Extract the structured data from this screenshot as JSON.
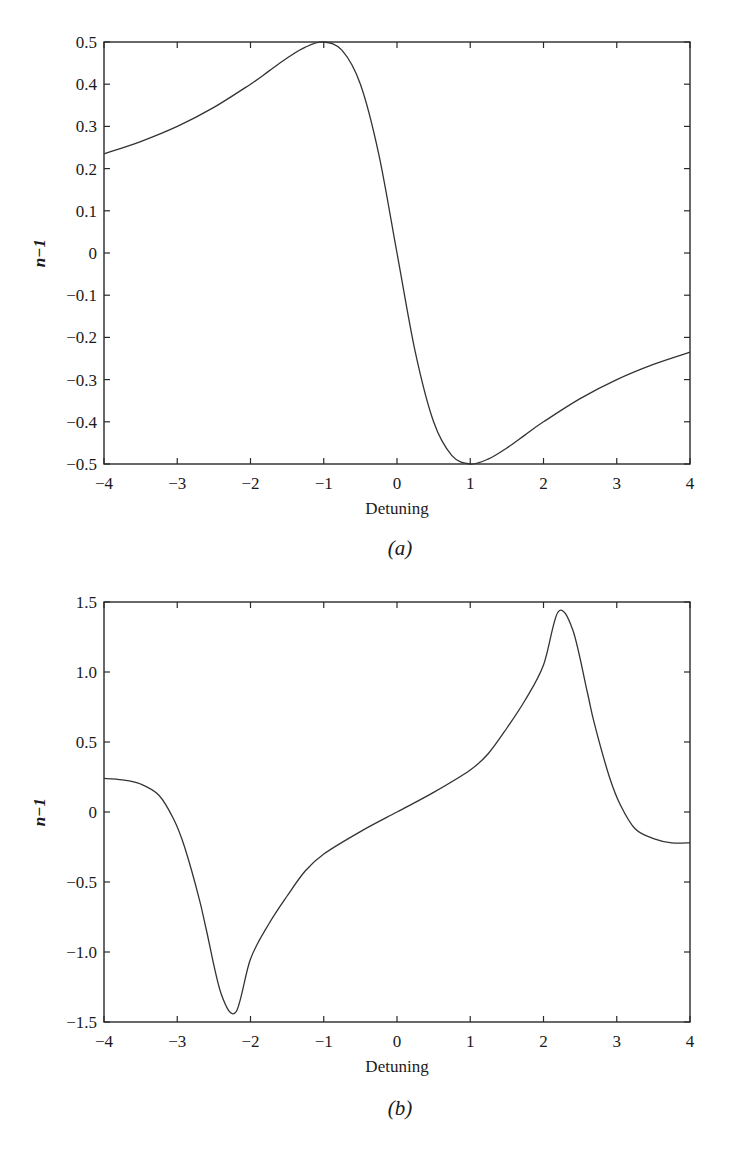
{
  "chart_data": [
    {
      "type": "line",
      "caption": "(a)",
      "title": "",
      "xlabel": "Detuning",
      "ylabel": "n−1",
      "xlim": [
        -4,
        4
      ],
      "ylim": [
        -0.5,
        0.5
      ],
      "xticks": [
        -4,
        -3,
        -2,
        -1,
        0,
        1,
        2,
        3,
        4
      ],
      "xtick_labels": [
        "−4",
        "−3",
        "−2",
        "−1",
        "0",
        "1",
        "2",
        "3",
        "4"
      ],
      "yticks": [
        0.5,
        0.4,
        0.3,
        0.2,
        0.1,
        0,
        -0.1,
        -0.2,
        -0.3,
        -0.4,
        -0.5
      ],
      "ytick_labels": [
        "0.5",
        "0.4",
        "0.3",
        "0.2",
        "0.1",
        "0",
        "−0.1",
        "−0.2",
        "−0.3",
        "−0.4",
        "−0.5"
      ],
      "grid": false,
      "legend": null,
      "series": [
        {
          "name": "n-1",
          "x": [
            -4,
            -3.5,
            -3,
            -2.5,
            -2,
            -1.75,
            -1.5,
            -1.25,
            -1,
            -0.75,
            -0.5,
            -0.25,
            0,
            0.25,
            0.5,
            0.75,
            1,
            1.25,
            1.5,
            1.75,
            2,
            2.5,
            3,
            3.5,
            4
          ],
          "y": [
            0.235,
            0.264,
            0.3,
            0.345,
            0.4,
            0.431,
            0.462,
            0.488,
            0.5,
            0.48,
            0.4,
            0.235,
            0,
            -0.235,
            -0.4,
            -0.48,
            -0.5,
            -0.488,
            -0.462,
            -0.431,
            -0.4,
            -0.345,
            -0.3,
            -0.264,
            -0.235
          ]
        }
      ]
    },
    {
      "type": "line",
      "caption": "(b)",
      "title": "",
      "xlabel": "Detuning",
      "ylabel": "n−1",
      "xlim": [
        -4,
        4
      ],
      "ylim": [
        -1.5,
        1.5
      ],
      "xticks": [
        -4,
        -3,
        -2,
        -1,
        0,
        1,
        2,
        3,
        4
      ],
      "xtick_labels": [
        "−4",
        "−3",
        "−2",
        "−1",
        "0",
        "1",
        "2",
        "3",
        "4"
      ],
      "yticks": [
        1.5,
        1.0,
        0.5,
        0,
        -0.5,
        -1.0,
        -1.5
      ],
      "ytick_labels": [
        "1.5",
        "1.0",
        "0.5",
        "0",
        "−0.5",
        "−1.0",
        "−1.5"
      ],
      "grid": false,
      "legend": null,
      "series": [
        {
          "name": "n-1",
          "x": [
            -4,
            -3.75,
            -3.5,
            -3.25,
            -3.05,
            -2.9,
            -2.7,
            -2.6,
            -2.4,
            -2.2,
            -2.0,
            -1.75,
            -1.5,
            -1.25,
            -1,
            -0.5,
            0,
            0.5,
            1,
            1.25,
            1.5,
            1.75,
            2.0,
            2.2,
            2.4,
            2.6,
            2.7,
            2.9,
            3.05,
            3.25,
            3.5,
            3.75,
            4
          ],
          "y": [
            0.24,
            0.23,
            0.2,
            0.12,
            -0.05,
            -0.25,
            -0.62,
            -0.85,
            -1.3,
            -1.43,
            -1.05,
            -0.8,
            -0.6,
            -0.42,
            -0.3,
            -0.14,
            0,
            0.14,
            0.3,
            0.42,
            0.6,
            0.8,
            1.05,
            1.43,
            1.3,
            0.85,
            0.62,
            0.25,
            0.05,
            -0.12,
            -0.19,
            -0.22,
            -0.22
          ]
        }
      ]
    }
  ]
}
